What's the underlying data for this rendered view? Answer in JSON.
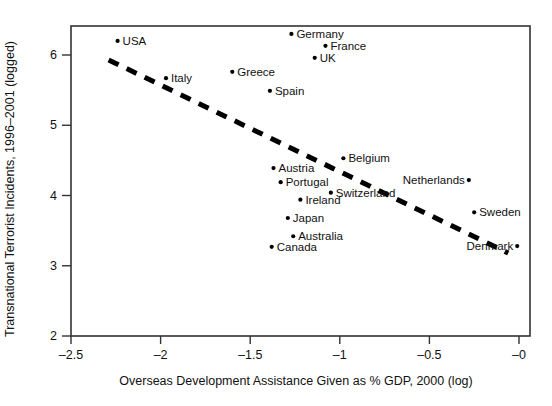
{
  "chart_data": {
    "type": "scatter",
    "title": "",
    "xlabel": "Overseas Development Assistance Given as % GDP, 2000 (log)",
    "ylabel": "Transnational Terrorist Incidents, 1996–2001 (logged)",
    "xlim": [
      -2.65,
      -0.03
    ],
    "ylim": [
      2.0,
      6.4
    ],
    "xticks": [
      -2.5,
      -2,
      -1.5,
      -1,
      -0.5,
      0
    ],
    "xtick_labels": [
      "–2.5",
      "–2",
      "–1.5",
      "–1",
      "–0.5",
      "–0"
    ],
    "yticks": [
      2,
      3,
      4,
      5,
      6
    ],
    "ytick_labels": [
      "2",
      "3",
      "4",
      "5",
      "6"
    ],
    "grid": false,
    "legend": "none",
    "marker_color": "#000000",
    "line_color": "#000000",
    "frame_color": "#333333",
    "points": [
      {
        "label": "USA",
        "x": -2.24,
        "y": 6.2,
        "label_side": "right"
      },
      {
        "label": "Germany",
        "x": -1.27,
        "y": 6.3,
        "label_side": "right"
      },
      {
        "label": "France",
        "x": -1.08,
        "y": 6.13,
        "label_side": "right"
      },
      {
        "label": "UK",
        "x": -1.14,
        "y": 5.96,
        "label_side": "right"
      },
      {
        "label": "Italy",
        "x": -1.97,
        "y": 5.67,
        "label_side": "right"
      },
      {
        "label": "Greece",
        "x": -1.6,
        "y": 5.76,
        "label_side": "right"
      },
      {
        "label": "Spain",
        "x": -1.39,
        "y": 5.49,
        "label_side": "right"
      },
      {
        "label": "Belgium",
        "x": -0.98,
        "y": 4.53,
        "label_side": "right"
      },
      {
        "label": "Austria",
        "x": -1.37,
        "y": 4.39,
        "label_side": "right"
      },
      {
        "label": "Portugal",
        "x": -1.33,
        "y": 4.19,
        "label_side": "right"
      },
      {
        "label": "Switzerland",
        "x": -1.05,
        "y": 4.04,
        "label_side": "right"
      },
      {
        "label": "Ireland",
        "x": -1.22,
        "y": 3.94,
        "label_side": "right"
      },
      {
        "label": "Japan",
        "x": -1.29,
        "y": 3.68,
        "label_side": "right"
      },
      {
        "label": "Australia",
        "x": -1.26,
        "y": 3.42,
        "label_side": "right"
      },
      {
        "label": "Canada",
        "x": -1.38,
        "y": 3.27,
        "label_side": "right"
      },
      {
        "label": "Netherlands",
        "x": -0.28,
        "y": 4.22,
        "label_side": "left"
      },
      {
        "label": "Sweden",
        "x": -0.25,
        "y": 3.76,
        "label_side": "right"
      },
      {
        "label": "Denmark",
        "x": -0.01,
        "y": 3.28,
        "label_side": "left"
      }
    ],
    "trend_line": {
      "style": "dashed",
      "x0": -2.29,
      "y0": 5.93,
      "x1": -0.06,
      "y1": 3.18
    }
  }
}
